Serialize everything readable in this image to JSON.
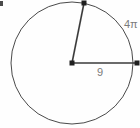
{
  "figure": {
    "background_color": "#fefefe",
    "stroke_color": "#4a4a4a",
    "label_color": "#7b7b7b"
  },
  "circle": {
    "center_x": 72,
    "center_y": 63,
    "radius": 61
  },
  "center_point": {
    "name": "center-vertex",
    "x": 72,
    "y": 63
  },
  "radii": [
    {
      "name": "horizontal-radius",
      "from_x": 72,
      "from_y": 63,
      "to_x": 138,
      "to_y": 63,
      "label": "9"
    },
    {
      "name": "slanted-radius",
      "from_x": 72,
      "from_y": 63,
      "to_x": 84,
      "to_y": 3,
      "label": ""
    }
  ],
  "endpoints": [
    {
      "name": "arc-endpoint-top",
      "x": 84,
      "y": 3
    },
    {
      "name": "arc-endpoint-right",
      "x": 137,
      "y": 63
    }
  ],
  "labels": {
    "arc_length": "4π",
    "radius_length": "9"
  },
  "artifact": {
    "name": "corner-mark",
    "visible": true
  }
}
